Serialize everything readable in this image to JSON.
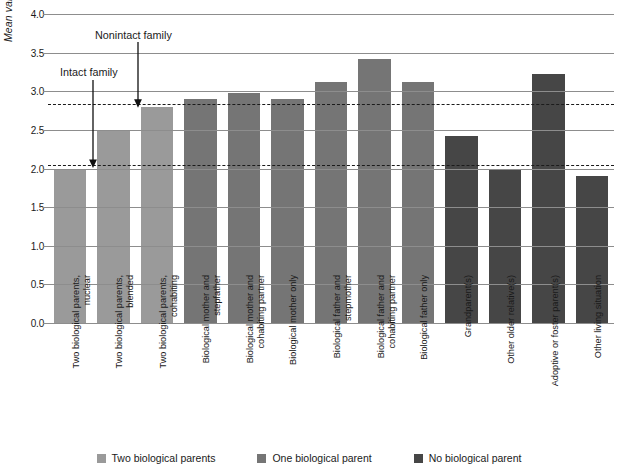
{
  "chart_data": {
    "type": "bar",
    "title": "",
    "xlabel": "",
    "ylabel": "Mean variety of antisocial behavior",
    "ylim": [
      0.0,
      4.0
    ],
    "ytick_labels": [
      "0.0",
      "0.5",
      "1.0",
      "1.5",
      "2.0",
      "2.5",
      "3.0",
      "3.5",
      "4.0"
    ],
    "ytick_values": [
      0.0,
      0.5,
      1.0,
      1.5,
      2.0,
      2.5,
      3.0,
      3.5,
      4.0
    ],
    "grid": true,
    "legend_position": "bottom",
    "categories": [
      "Two biological parents, nuclear",
      "Two biological parents, blended",
      "Two biological parents, cohabiting",
      "Biological mother and stepfather",
      "Biological mother and cohabiting partner",
      "Biological mother only",
      "Biological father and stepmother",
      "Biological father and cohabiting partner",
      "Biological father only",
      "Grandparent(s)",
      "Other older relative(s)",
      "Adoptive or foster parent(s)",
      "Other living situation"
    ],
    "values": [
      2.0,
      2.5,
      2.8,
      2.9,
      2.98,
      2.9,
      3.12,
      3.42,
      3.12,
      2.42,
      2.0,
      3.22,
      1.9
    ],
    "groups": [
      "Two biological parents",
      "Two biological parents",
      "Two biological parents",
      "One biological parent",
      "One biological parent",
      "One biological parent",
      "One biological parent",
      "One biological parent",
      "One biological parent",
      "No biological parent",
      "No biological parent",
      "No biological parent",
      "No biological parent"
    ],
    "reference_lines": [
      {
        "label": "Intact family",
        "value": 2.05
      },
      {
        "label": "Nonintact family",
        "value": 2.83
      }
    ],
    "annotations": [
      {
        "label": "Intact family",
        "target_value": 2.05
      },
      {
        "label": "Nonintact family",
        "target_value": 2.83
      }
    ]
  },
  "legend": {
    "items": [
      {
        "label": "Two biological parents",
        "color": "#9a9a9a"
      },
      {
        "label": "One biological parent",
        "color": "#757575"
      },
      {
        "label": "No biological parent",
        "color": "#464646"
      }
    ]
  },
  "colors": {
    "two_biological_parents": "#9a9a9a",
    "one_biological_parent": "#757575",
    "no_biological_parent": "#464646",
    "gridline": "#8d8d8d",
    "dashed_reference": "#1b1b1b",
    "background": "#ffffff"
  }
}
